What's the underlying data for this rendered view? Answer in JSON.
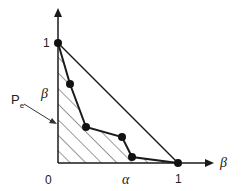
{
  "diagram": {
    "x_axis_label": "β",
    "y_axis_label": "1",
    "origin_label": "0",
    "x_tick_label": "1",
    "y_tick_label": "1",
    "alpha_label": "α",
    "beta_side_label": "β",
    "region_label": "P",
    "region_label_sub": "e",
    "colors": {
      "line": "#1a1a1a",
      "hatch": "#333333",
      "background": "#ffffff"
    },
    "points": [
      {
        "x": 58,
        "y": 43
      },
      {
        "x": 70,
        "y": 84
      },
      {
        "x": 86,
        "y": 127
      },
      {
        "x": 122,
        "y": 137
      },
      {
        "x": 132,
        "y": 157
      },
      {
        "x": 178,
        "y": 163
      }
    ]
  }
}
